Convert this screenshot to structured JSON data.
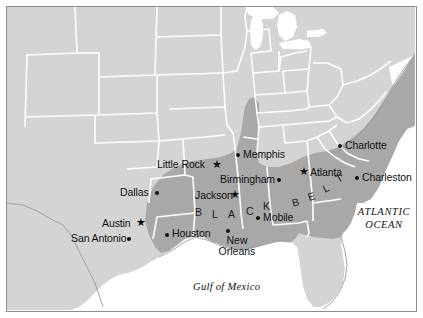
{
  "figure": {
    "kind": "thematic-map",
    "region": "Southeastern United States",
    "frame_color": "#8d8d8d",
    "background_color": "#ffffff"
  },
  "legend_colors": {
    "land": "#d4d4d4",
    "highlight_region": "#a8a8a8",
    "water": "#ffffff",
    "state_border": "#ffffff",
    "coastline": "#9a9a9a",
    "ink": "#111111"
  },
  "region_label": {
    "name": "black-belt",
    "letters": [
      "B",
      "L",
      "A",
      "C",
      "K",
      "B",
      "E",
      "L",
      "T"
    ],
    "text": "BLACK BELT"
  },
  "water_labels": [
    {
      "name": "atlantic-ocean",
      "line1": "ATLANTIC",
      "line2": "OCEAN"
    },
    {
      "name": "gulf-of-mexico",
      "text": "Gulf of Mexico"
    }
  ],
  "cities": [
    {
      "name": "little-rock",
      "label": "Little Rock",
      "marker": "star",
      "marker_side": "right"
    },
    {
      "name": "memphis",
      "label": "Memphis",
      "marker": "dot",
      "marker_side": "left"
    },
    {
      "name": "birmingham",
      "label": "Birmingham",
      "marker": "dot",
      "marker_side": "right"
    },
    {
      "name": "charlotte",
      "label": "Charlotte",
      "marker": "dot",
      "marker_side": "left"
    },
    {
      "name": "atlanta",
      "label": "Atlanta",
      "marker": "star",
      "marker_side": "left"
    },
    {
      "name": "charleston",
      "label": "Charleston",
      "marker": "dot",
      "marker_side": "left"
    },
    {
      "name": "dallas",
      "label": "Dallas",
      "marker": "dot",
      "marker_side": "right"
    },
    {
      "name": "jackson",
      "label": "Jackson",
      "marker": "star",
      "marker_side": "right"
    },
    {
      "name": "mobile",
      "label": "Mobile",
      "marker": "dot",
      "marker_side": "left"
    },
    {
      "name": "austin",
      "label": "Austin",
      "marker": "star",
      "marker_side": "right"
    },
    {
      "name": "houston",
      "label": "Houston",
      "marker": "dot",
      "marker_side": "left"
    },
    {
      "name": "san-antonio",
      "label": "San Antonio",
      "marker": "dot",
      "marker_side": "right"
    },
    {
      "name": "new-orleans",
      "label": "New\nOrleans",
      "label_line1": "New",
      "label_line2": "Orleans",
      "marker": "dot",
      "marker_side": "topleft"
    }
  ]
}
